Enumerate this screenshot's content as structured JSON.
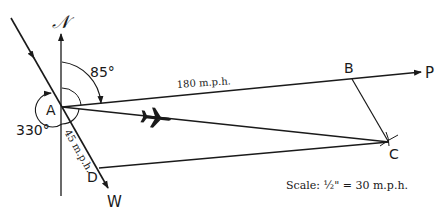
{
  "diagram": {
    "type": "vector-navigation-diagram",
    "labels": {
      "north": "𝒩",
      "angle_heading": "85°",
      "angle_wind": "330°",
      "airspeed": "180 m.p.h.",
      "windspeed": "45 m.p.h.",
      "point_a": "A",
      "point_b": "B",
      "point_c": "C",
      "point_d": "D",
      "point_p": "P",
      "point_w": "W",
      "scale": "Scale: ½\" = 30 m.p.h."
    },
    "icons": {
      "airplane": "airplane-icon"
    },
    "colors": {
      "ink": "#1a1a1a",
      "background": "#ffffff"
    }
  }
}
